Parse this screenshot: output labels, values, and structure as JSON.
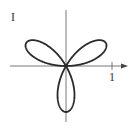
{
  "chart_data": {
    "type": "line",
    "title": "",
    "equation": "r = sin 3θ",
    "ylabel": "1",
    "xlabel": "1",
    "xlim": [
      -1.1,
      1.3
    ],
    "ylim": [
      -1.1,
      1.1
    ],
    "grid": false,
    "petals": 3,
    "petal_tip_angles_deg": [
      30,
      150,
      270
    ],
    "x_tick": 1,
    "colors": {
      "curve": "#2b2b2b",
      "axes": "#555555"
    }
  },
  "labels": {
    "y_tick": "I",
    "x_tick": "1"
  }
}
